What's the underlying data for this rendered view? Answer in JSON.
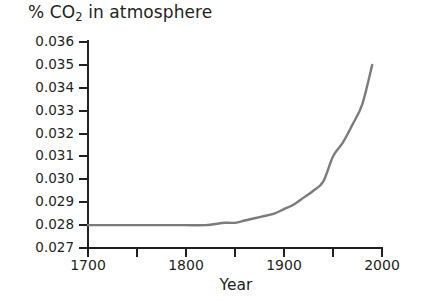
{
  "chart_data": {
    "type": "line",
    "title": "% CO2 in atmosphere",
    "title_prefix": "% CO",
    "title_subscript": "2",
    "title_suffix": " in atmosphere",
    "xlabel": "Year",
    "ylabel": "",
    "xlim": [
      1700,
      2000
    ],
    "ylim": [
      0.027,
      0.036
    ],
    "xticks": [
      1700,
      1750,
      1800,
      1850,
      1900,
      1950,
      2000
    ],
    "xtick_labels": [
      "1700",
      "",
      "1800",
      "",
      "1900",
      "",
      "2000"
    ],
    "yticks": [
      0.027,
      0.028,
      0.029,
      0.03,
      0.031,
      0.032,
      0.033,
      0.034,
      0.035,
      0.036
    ],
    "ytick_labels": [
      "0.027",
      "0.028",
      "0.029",
      "0.030",
      "0.031",
      "0.032",
      "0.033",
      "0.034",
      "0.035",
      "0.036"
    ],
    "grid": false,
    "legend": null,
    "line_color": "#7b7b7b",
    "axis_color": "#231f20",
    "series": [
      {
        "name": "CO2 concentration",
        "x": [
          1700,
          1720,
          1740,
          1760,
          1780,
          1800,
          1820,
          1840,
          1850,
          1860,
          1870,
          1880,
          1890,
          1900,
          1910,
          1920,
          1930,
          1940,
          1950,
          1960,
          1970,
          1980,
          1990
        ],
        "values": [
          0.028,
          0.028,
          0.028,
          0.028,
          0.028,
          0.028,
          0.028,
          0.0281,
          0.0281,
          0.0282,
          0.0283,
          0.0284,
          0.0285,
          0.0287,
          0.0289,
          0.0292,
          0.0295,
          0.0299,
          0.031,
          0.0316,
          0.0324,
          0.0333,
          0.035
        ]
      }
    ]
  },
  "axes": {
    "x_title": "Year"
  }
}
